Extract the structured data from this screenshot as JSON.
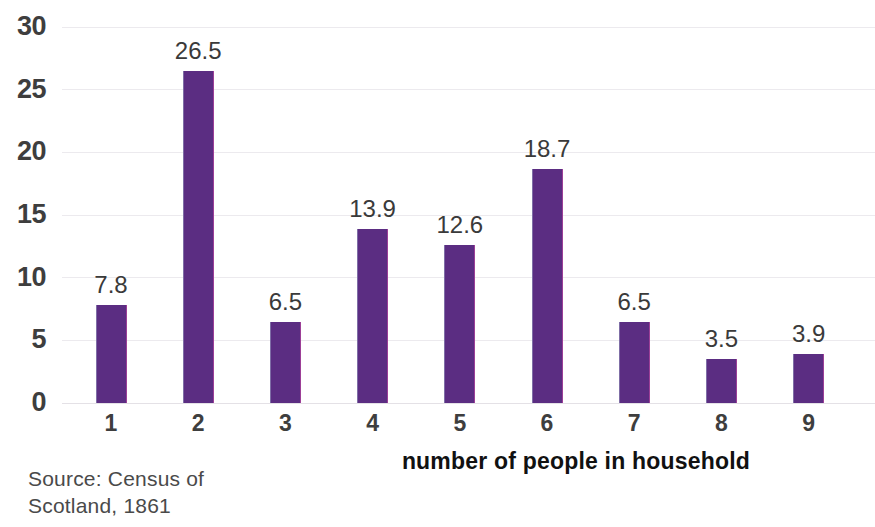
{
  "chart_data": {
    "type": "bar",
    "title": "",
    "subtitle": "",
    "xlabel": "number of people in household",
    "ylabel": "",
    "categories": [
      "1",
      "2",
      "3",
      "4",
      "5",
      "6",
      "7",
      "8",
      "9"
    ],
    "values": [
      7.8,
      26.5,
      6.5,
      13.9,
      12.6,
      18.7,
      6.5,
      3.5,
      3.9
    ],
    "value_labels": [
      "7.8",
      "26.5",
      "6.5",
      "13.9",
      "12.6",
      "18.7",
      "6.5",
      "3.5",
      "3.9"
    ],
    "series": [
      {
        "name": "percentage of households",
        "values": [
          7.8,
          26.5,
          6.5,
          13.9,
          12.6,
          18.7,
          6.5,
          3.5,
          3.9
        ],
        "color": "#5b2d82"
      }
    ],
    "ylim": [
      0,
      30
    ],
    "ytick_values": [
      0,
      5,
      10,
      15,
      20,
      25,
      30
    ],
    "ytick_labels": [
      "0",
      "5",
      "10",
      "15",
      "20",
      "25",
      "30"
    ],
    "grid": true,
    "grid_axis": "y",
    "legend": false,
    "legend_position": "none",
    "bar_color": "#5b2d82",
    "annotations": [
      "Source: Census of",
      "Scotland, 1861"
    ]
  },
  "source": {
    "line1": "Source: Census of",
    "line2": "Scotland, 1861"
  },
  "colors": {
    "bar": "#5b2d82",
    "gridline": "#eceaee",
    "tick_text": "#3e3e3e",
    "value_text": "#3a3a3a",
    "axis_title_text": "#111111",
    "source_text": "#4a4a4a",
    "background": "#ffffff"
  }
}
